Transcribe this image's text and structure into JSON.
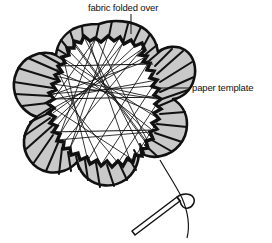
{
  "figure": {
    "background_color": "#ffffff",
    "line_color": "#111111",
    "fabric_band_color": "#c9c9c9",
    "paper_fill_color": "#ffffff"
  },
  "labels": {
    "top": {
      "text": "fabric folded over",
      "leader": "vertical-line-down"
    },
    "right": {
      "text": "paper template",
      "leader": "horizontal-line-left"
    }
  },
  "parts": {
    "fabric_band_name": "fabric folded over",
    "paper_template_name": "paper template",
    "needle_name": "sewing needle",
    "thread_name": "basting thread",
    "shape_name": "quatrefoil clover outline"
  }
}
